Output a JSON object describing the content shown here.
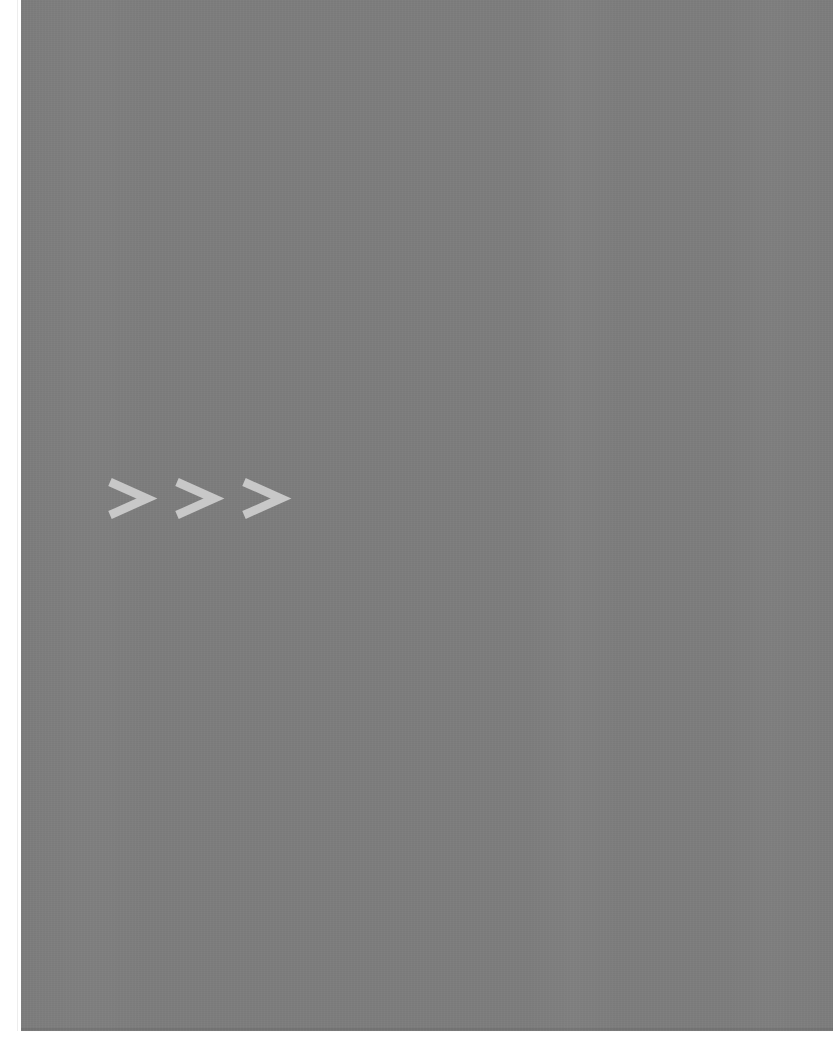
{
  "canvas": {
    "width": 833,
    "height": 1044,
    "page_background": "#ffffff"
  },
  "panel": {
    "name": "gray content panel",
    "fill_color": "#7d7d7d",
    "left": 21,
    "top": 0,
    "width": 812,
    "height": 1031,
    "separator_color": "#ededed"
  },
  "chevrons": {
    "label": "> > >",
    "count": 3,
    "color": "#c8c8c8",
    "direction": "right",
    "stroke_width": 8.5,
    "items": [
      {
        "glyph": ">",
        "name": "chevron-right-icon-1"
      },
      {
        "glyph": ">",
        "name": "chevron-right-icon-2"
      },
      {
        "glyph": ">",
        "name": "chevron-right-icon-3"
      }
    ]
  }
}
